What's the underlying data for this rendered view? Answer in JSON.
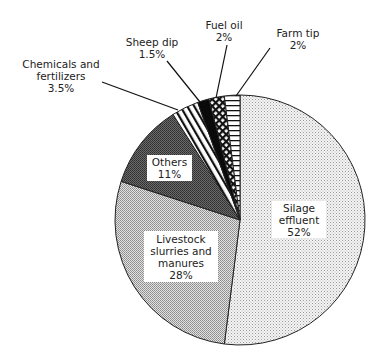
{
  "chart_data": {
    "type": "pie",
    "title": "",
    "start_angle_deg": 0,
    "direction": "slices listed clockwise from 12 o'clock",
    "slices": [
      {
        "label": "Silage effluent",
        "value": 52,
        "display": "52%",
        "pattern": "fine-dots-light"
      },
      {
        "label": "Livestock slurries and manures",
        "value": 28,
        "display": "28%",
        "pattern": "fine-dots-medium"
      },
      {
        "label": "Others",
        "value": 11,
        "display": "11%",
        "pattern": "crosshatch-dark"
      },
      {
        "label": "Chemicals and fertilizers",
        "value": 3.5,
        "display": "3.5%",
        "pattern": "diagonal-stripes"
      },
      {
        "label": "Sheep dip",
        "value": 1.5,
        "display": "1.5%",
        "pattern": "solid-black"
      },
      {
        "label": "Fuel oil",
        "value": 2,
        "display": "2%",
        "pattern": "diamond-crosshatch"
      },
      {
        "label": "Farm tip",
        "value": 2,
        "display": "2%",
        "pattern": "horizontal-stripes"
      }
    ],
    "legend": "none (callout labels)"
  },
  "labels": {
    "silage": {
      "line1": "Silage",
      "line2": "effluent",
      "pct": "52%"
    },
    "livestock": {
      "line1": "Livestock",
      "line2": "slurries and",
      "line3": "manures",
      "pct": "28%"
    },
    "others": {
      "line1": "Others",
      "pct": "11%"
    },
    "chemicals": {
      "line1": "Chemicals and",
      "line2": "fertilizers",
      "pct": "3.5%"
    },
    "sheep": {
      "line1": "Sheep dip",
      "pct": "1.5%"
    },
    "fuel": {
      "line1": "Fuel oil",
      "pct": "2%"
    },
    "farm": {
      "line1": "Farm tip",
      "pct": "2%"
    }
  }
}
